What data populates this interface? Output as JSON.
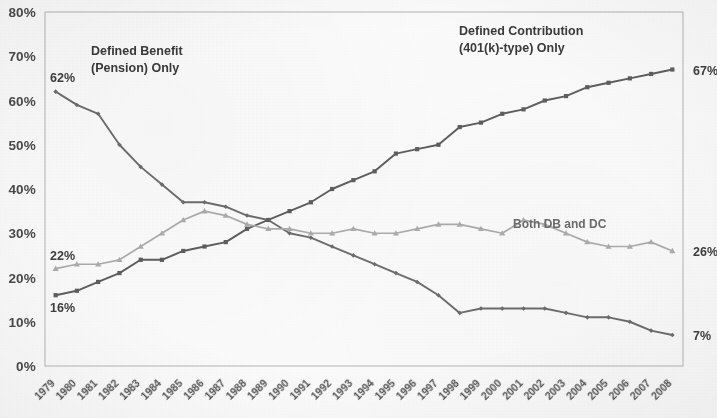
{
  "chart_data": {
    "type": "line",
    "title": "",
    "xlabel": "",
    "ylabel": "",
    "ylim": [
      0,
      80
    ],
    "y_ticks": [
      "0%",
      "10%",
      "20%",
      "30%",
      "40%",
      "50%",
      "60%",
      "70%",
      "80%"
    ],
    "y_tick_values": [
      0,
      10,
      20,
      30,
      40,
      50,
      60,
      70,
      80
    ],
    "grid": true,
    "legend_position": "inline-annotations",
    "categories": [
      "1979",
      "1980",
      "1981",
      "1982",
      "1983",
      "1984",
      "1985",
      "1986",
      "1987",
      "1988",
      "1989",
      "1990",
      "1991",
      "1992",
      "1993",
      "1994",
      "1995",
      "1996",
      "1997",
      "1998",
      "1999",
      "2000",
      "2001",
      "2002",
      "2003",
      "2004",
      "2005",
      "2006",
      "2007",
      "2008"
    ],
    "series": [
      {
        "name": "Defined Benefit (Pension) Only",
        "marker": "diamond",
        "color": "#6e6e6e",
        "start_label": "62%",
        "end_label": "7%",
        "values": [
          62,
          59,
          57,
          50,
          45,
          41,
          37,
          37,
          36,
          34,
          33,
          30,
          29,
          27,
          25,
          23,
          21,
          19,
          16,
          12,
          13,
          13,
          13,
          13,
          12,
          11,
          11,
          10,
          8,
          7
        ]
      },
      {
        "name": "Defined Contribution (401(k)-type) Only",
        "marker": "square",
        "color": "#5e5e5e",
        "start_label": "16%",
        "end_label": "67%",
        "values": [
          16,
          17,
          19,
          21,
          24,
          24,
          26,
          27,
          28,
          31,
          33,
          35,
          37,
          40,
          42,
          44,
          48,
          49,
          50,
          54,
          55,
          57,
          58,
          60,
          61,
          63,
          64,
          65,
          66,
          67
        ]
      },
      {
        "name": "Both DB and DC",
        "marker": "triangle",
        "color": "#aeaeae",
        "start_label": "22%",
        "end_label": "26%",
        "values": [
          22,
          23,
          23,
          24,
          27,
          30,
          33,
          35,
          34,
          32,
          31,
          31,
          30,
          30,
          31,
          30,
          30,
          31,
          32,
          32,
          31,
          30,
          33,
          32,
          30,
          28,
          27,
          27,
          28,
          26
        ]
      }
    ],
    "annotations": [
      {
        "id": "db-annotation",
        "text_line1": "Defined Benefit",
        "text_line2": "(Pension) Only"
      },
      {
        "id": "dc-annotation",
        "text_line1": "Defined Contribution",
        "text_line2": "(401(k)-type) Only"
      },
      {
        "id": "both-annotation",
        "text_line1": "Both DB and DC",
        "text_line2": ""
      }
    ],
    "endpoint_labels": {
      "left": [
        "62%",
        "22%",
        "16%"
      ],
      "right": [
        "67%",
        "26%",
        "7%"
      ]
    },
    "colors": {
      "defined_benefit": "#6e6e6e",
      "defined_contribution": "#5e5e5e",
      "both": "#aeaeae",
      "gridline": "#d6d6d6",
      "background": "#fdfdfd",
      "text": "#4b4b4b"
    }
  }
}
